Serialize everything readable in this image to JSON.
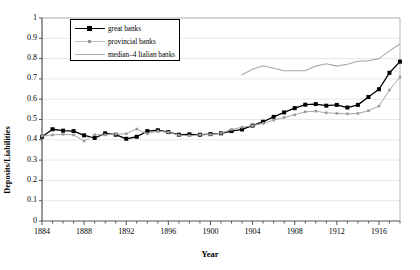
{
  "chart_data": {
    "type": "line",
    "title": "",
    "xlabel": "Year",
    "ylabel": "Deposits/Liabilities",
    "xlim": [
      1884,
      1918
    ],
    "ylim": [
      0,
      1
    ],
    "yticks": [
      "0",
      "0.1",
      "0.2",
      "0.3",
      "0.4",
      "0.5",
      "0.6",
      "0.7",
      "0.8",
      "0.9",
      "1"
    ],
    "xticks": [
      "1884",
      "1888",
      "1892",
      "1896",
      "1900",
      "1904",
      "1908",
      "1912",
      "1916"
    ],
    "xtick_step": 4,
    "minor_xtick_step": 1,
    "grid": "horizontal",
    "legend_position": "top-left",
    "series": [
      {
        "name": "great banks",
        "color": "#000000",
        "marker": "square",
        "x": [
          1884,
          1885,
          1886,
          1887,
          1888,
          1889,
          1890,
          1891,
          1892,
          1893,
          1894,
          1895,
          1896,
          1897,
          1898,
          1899,
          1900,
          1901,
          1902,
          1903,
          1904,
          1905,
          1906,
          1907,
          1908,
          1909,
          1910,
          1911,
          1912,
          1913,
          1914,
          1915,
          1916,
          1917,
          1918
        ],
        "y": [
          0.415,
          0.452,
          0.445,
          0.443,
          0.422,
          0.409,
          0.432,
          0.425,
          0.405,
          0.415,
          0.443,
          0.447,
          0.438,
          0.425,
          0.427,
          0.425,
          0.428,
          0.432,
          0.443,
          0.451,
          0.47,
          0.489,
          0.513,
          0.535,
          0.556,
          0.573,
          0.576,
          0.568,
          0.572,
          0.559,
          0.572,
          0.611,
          0.649,
          0.73,
          0.785
        ]
      },
      {
        "name": "provincial banks",
        "color": "#a8a8a8",
        "marker": "dot",
        "x": [
          1884,
          1885,
          1886,
          1887,
          1888,
          1889,
          1890,
          1891,
          1892,
          1893,
          1894,
          1895,
          1896,
          1897,
          1898,
          1899,
          1900,
          1901,
          1902,
          1903,
          1904,
          1905,
          1906,
          1907,
          1908,
          1909,
          1910,
          1911,
          1912,
          1913,
          1914,
          1915,
          1916,
          1917,
          1918
        ],
        "y": [
          0.418,
          0.424,
          0.427,
          0.424,
          0.394,
          0.425,
          0.424,
          0.428,
          0.43,
          0.453,
          0.43,
          0.443,
          0.437,
          0.423,
          0.42,
          0.425,
          0.426,
          0.432,
          0.451,
          0.462,
          0.47,
          0.481,
          0.497,
          0.51,
          0.523,
          0.538,
          0.541,
          0.533,
          0.53,
          0.528,
          0.53,
          0.543,
          0.566,
          0.645,
          0.709
        ]
      },
      {
        "name": "median–4 Italian banks",
        "color": "#a8a8a8",
        "marker": "none",
        "x": [
          1903,
          1904,
          1905,
          1906,
          1907,
          1908,
          1909,
          1910,
          1911,
          1912,
          1913,
          1914,
          1915,
          1916,
          1917,
          1918
        ],
        "y": [
          0.72,
          0.748,
          0.765,
          0.752,
          0.74,
          0.74,
          0.74,
          0.763,
          0.775,
          0.763,
          0.772,
          0.787,
          0.789,
          0.8,
          0.838,
          0.872
        ]
      }
    ]
  },
  "legend": {
    "items": [
      {
        "label": "great banks"
      },
      {
        "label": "provincial banks"
      },
      {
        "label": "median–4 Italian banks"
      }
    ]
  }
}
